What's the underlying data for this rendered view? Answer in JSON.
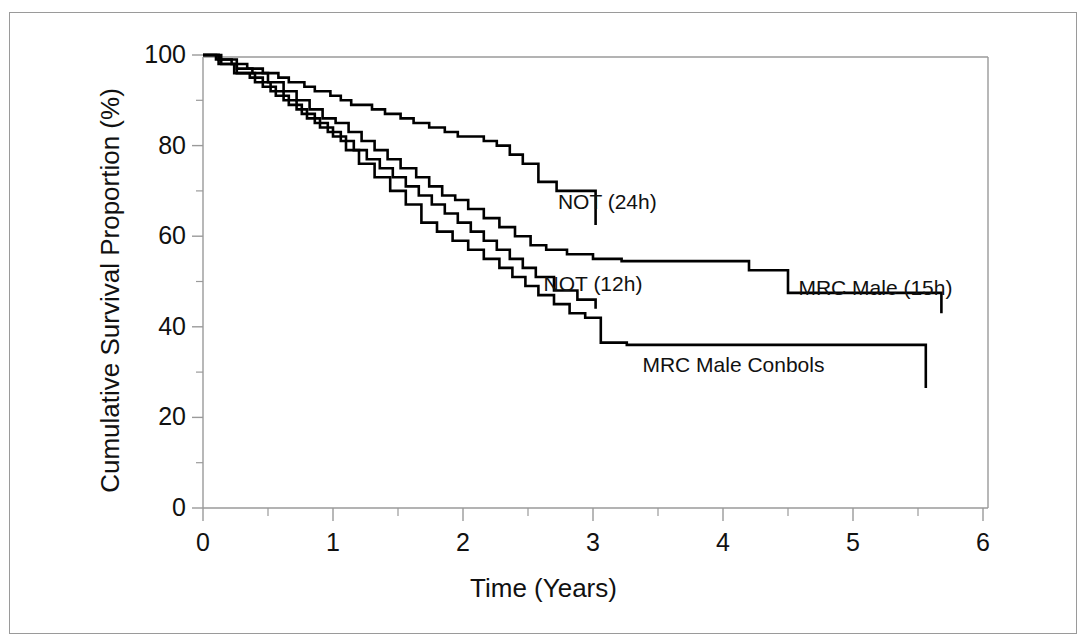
{
  "figure": {
    "background_color": "#ffffff",
    "frame_color": "#9a9a9a",
    "line_color": "#000000"
  },
  "chart_data": {
    "type": "line",
    "title": "",
    "subtitle": "",
    "xlabel": "Time (Years)",
    "ylabel": "Cumulative Survival Proportion (%)",
    "xlim": [
      0,
      6
    ],
    "ylim": [
      0,
      100
    ],
    "xticks": [
      0,
      1,
      2,
      3,
      4,
      5,
      6
    ],
    "xtick_labels": [
      "0",
      "1",
      "2",
      "3",
      "4",
      "5",
      "6"
    ],
    "xminor_ticks": [
      0.5,
      1.5,
      2.5,
      3.5,
      4.5,
      5.5
    ],
    "yticks": [
      0,
      20,
      40,
      60,
      80,
      100
    ],
    "ytick_labels": [
      "0",
      "20",
      "40",
      "60",
      "80",
      "100"
    ],
    "yminor_ticks": [
      10,
      30,
      50,
      70,
      90
    ],
    "grid": false,
    "legend_position": "inline-annotations",
    "step_style": "post",
    "series": [
      {
        "name": "NOT (24h)",
        "label": "NOT (24h)",
        "label_x": 2.73,
        "label_y": 67.5,
        "x": [
          0.0,
          0.1,
          0.22,
          0.34,
          0.46,
          0.58,
          0.66,
          0.78,
          0.86,
          0.98,
          1.06,
          1.14,
          1.22,
          1.3,
          1.4,
          1.52,
          1.62,
          1.74,
          1.86,
          1.96,
          2.06,
          2.16,
          2.26,
          2.36,
          2.46,
          2.58,
          2.72,
          3.02
        ],
        "y": [
          100,
          99,
          98,
          97,
          96,
          95,
          94,
          93,
          92,
          91,
          90,
          89,
          89,
          88,
          87,
          86,
          85,
          84,
          83,
          82,
          82,
          81,
          80,
          78,
          76,
          72,
          70,
          62.5
        ]
      },
      {
        "name": "MRC Male (15h)",
        "label": "MRC Male (15h)",
        "label_x": 4.58,
        "label_y": 48.5,
        "x": [
          0.0,
          0.12,
          0.26,
          0.38,
          0.5,
          0.62,
          0.72,
          0.82,
          0.92,
          1.02,
          1.12,
          1.22,
          1.32,
          1.42,
          1.52,
          1.64,
          1.74,
          1.84,
          1.94,
          2.04,
          2.16,
          2.28,
          2.4,
          2.52,
          2.64,
          2.8,
          3.0,
          3.22,
          4.2,
          4.5,
          5.68
        ],
        "y": [
          100,
          99,
          97,
          96,
          94,
          92,
          90,
          88,
          86,
          85,
          83,
          81,
          79,
          77,
          75,
          73,
          71,
          69,
          68,
          66,
          64,
          62,
          60,
          58,
          57,
          56,
          55,
          54.5,
          52.5,
          47.5,
          43
        ]
      },
      {
        "name": "NOT (12h)",
        "label": "NOT (12h)",
        "label_x": 2.62,
        "label_y": 49.5,
        "x": [
          0.0,
          0.12,
          0.24,
          0.36,
          0.46,
          0.56,
          0.66,
          0.76,
          0.86,
          0.96,
          1.06,
          1.16,
          1.26,
          1.36,
          1.46,
          1.56,
          1.66,
          1.76,
          1.86,
          1.96,
          2.06,
          2.16,
          2.26,
          2.36,
          2.46,
          2.56,
          2.7,
          2.88,
          3.02
        ],
        "y": [
          100,
          98,
          96,
          95,
          93,
          91,
          89,
          87,
          85,
          83,
          81,
          79,
          77,
          75,
          73,
          71,
          69,
          67,
          65,
          63,
          61,
          59,
          57,
          55,
          53,
          51,
          48,
          46,
          44
        ]
      },
      {
        "name": "MRC Male Controls",
        "label": "MRC Male Conbols",
        "label_x": 3.38,
        "label_y": 31.5,
        "x": [
          0.0,
          0.14,
          0.26,
          0.4,
          0.52,
          0.62,
          0.72,
          0.8,
          0.9,
          1.0,
          1.1,
          1.2,
          1.32,
          1.44,
          1.56,
          1.68,
          1.8,
          1.92,
          2.04,
          2.16,
          2.28,
          2.38,
          2.48,
          2.58,
          2.7,
          2.82,
          2.94,
          3.06,
          3.26,
          5.56
        ],
        "y": [
          100,
          98,
          96,
          94,
          92,
          90,
          88,
          86,
          84,
          82,
          79,
          76,
          73,
          70,
          67,
          63,
          61,
          59,
          57,
          55,
          53,
          51,
          49,
          47,
          45,
          43,
          42,
          36.5,
          36,
          26.5
        ]
      }
    ]
  }
}
